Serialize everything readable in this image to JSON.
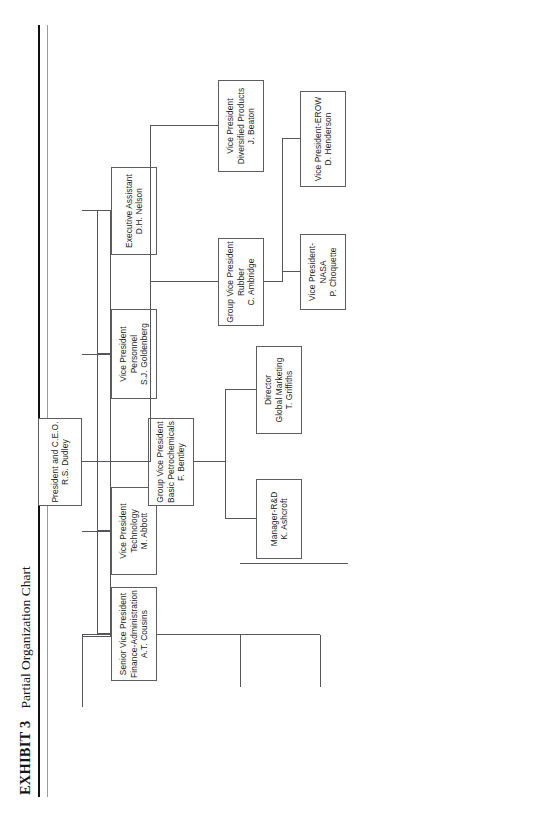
{
  "page": {
    "background": "#ffffff",
    "ink": "#1b1b1b",
    "rule_color": "#111111",
    "box_border": "#5d5d5d"
  },
  "title": {
    "exhibit_label": "EXHIBIT 3",
    "caption": "Partial Organization Chart"
  },
  "chart_data": {
    "type": "diagram",
    "title": "Partial Organization Chart",
    "nodes": [
      {
        "id": "ceo",
        "name": "president-ceo",
        "lines": [
          "President and C.E.O.",
          "R.S. Dudley"
        ]
      },
      {
        "id": "svp_fin",
        "name": "svp-finance-administration",
        "lines": [
          "Senior Vice President",
          "Finance-Administration",
          "A.T. Cousins"
        ]
      },
      {
        "id": "vp_tech",
        "name": "vp-technology",
        "lines": [
          "Vice President",
          "Technology",
          "M. Abbott"
        ]
      },
      {
        "id": "vp_pers",
        "name": "vp-personnel",
        "lines": [
          "Vice President",
          "Personnel",
          "S.J. Goldenberg"
        ]
      },
      {
        "id": "exec_asst",
        "name": "executive-assistant",
        "lines": [
          "Executive Assistant",
          "D.H. Nelson"
        ]
      },
      {
        "id": "vp_div",
        "name": "vp-diversified-products",
        "lines": [
          "Vice President",
          "Diversified Products",
          "J. Beaton"
        ]
      },
      {
        "id": "gvp_rubber",
        "name": "gvp-rubber",
        "lines": [
          "Group Vice President",
          "Rubber",
          "C. Ambridge"
        ]
      },
      {
        "id": "gvp_petro",
        "name": "gvp-basic-petrochemicals",
        "lines": [
          "Group Vice President",
          "Basic Petrochemicals",
          "F. Bentley"
        ]
      },
      {
        "id": "vp_erow",
        "name": "vp-erow",
        "lines": [
          "Vice President-EROW",
          "D. Henderson"
        ]
      },
      {
        "id": "vp_nasa",
        "name": "vp-nasa",
        "lines": [
          "Vice President-",
          "NASA",
          "P. Choquette"
        ]
      },
      {
        "id": "dir_mktg",
        "name": "director-global-marketing",
        "lines": [
          "Director",
          "Global Marketing",
          "T. Griffiths"
        ]
      },
      {
        "id": "mgr_rd",
        "name": "manager-rd",
        "lines": [
          "Manager-R&D",
          "K. Ashcroft"
        ]
      }
    ],
    "edges": [
      {
        "from": "ceo",
        "to": "svp_fin"
      },
      {
        "from": "ceo",
        "to": "vp_tech"
      },
      {
        "from": "ceo",
        "to": "vp_pers"
      },
      {
        "from": "ceo",
        "to": "exec_asst"
      },
      {
        "from": "ceo",
        "to": "vp_div"
      },
      {
        "from": "ceo",
        "to": "gvp_rubber"
      },
      {
        "from": "ceo",
        "to": "gvp_petro"
      },
      {
        "from": "gvp_rubber",
        "to": "vp_erow"
      },
      {
        "from": "gvp_rubber",
        "to": "vp_nasa"
      },
      {
        "from": "gvp_petro",
        "to": "dir_mktg"
      },
      {
        "from": "gvp_petro",
        "to": "mgr_rd"
      }
    ]
  }
}
